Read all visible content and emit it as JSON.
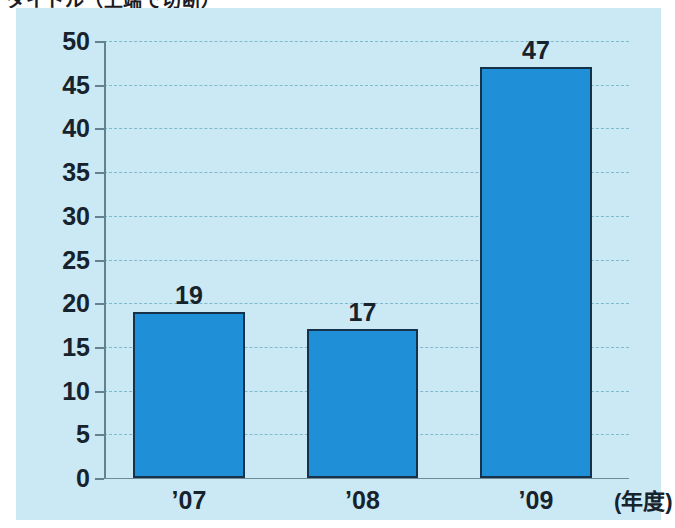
{
  "title_partial": "タイトル（上端で切断）",
  "panel": {
    "background_color": "#cbe9f4"
  },
  "chart_data": {
    "type": "bar",
    "title": "",
    "xlabel": "(年度)",
    "ylabel": "",
    "categories": [
      "’07",
      "’08",
      "’09"
    ],
    "values": [
      19,
      17,
      47
    ],
    "value_labels": [
      "19",
      "17",
      "47"
    ],
    "ylim": [
      0,
      50
    ],
    "ytick_step": 5,
    "yticks": [
      0,
      5,
      10,
      15,
      20,
      25,
      30,
      35,
      40,
      45,
      50
    ],
    "ytick_labels": [
      "0",
      "5",
      "10",
      "15",
      "20",
      "25",
      "30",
      "35",
      "40",
      "45",
      "50"
    ],
    "grid": true,
    "grid_style": "dashed",
    "grid_color": "#7fb9cf",
    "legend": false,
    "bar_color": "#1f8fd8",
    "bar_outline_color": "#16324a",
    "axis_color": "#64818d"
  }
}
